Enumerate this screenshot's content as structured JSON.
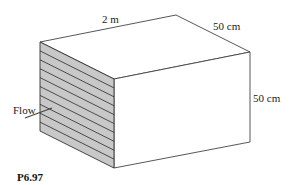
{
  "labels": {
    "length": "2 m",
    "depth": "50 cm",
    "height": "50 cm",
    "flow": "Flow",
    "figure_id": "P6.97"
  },
  "diagram": {
    "plate_bands": 10,
    "colors": {
      "edge": "#333333",
      "shaded_face": "#c8c8c8",
      "face": "#ffffff"
    }
  }
}
